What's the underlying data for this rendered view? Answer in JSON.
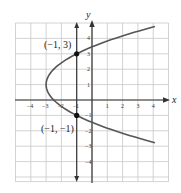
{
  "chart_data": {
    "type": "line",
    "title": "",
    "xlabel": "x",
    "ylabel": "y",
    "xlim": [
      -5,
      5
    ],
    "ylim": [
      -5.3,
      5
    ],
    "grid": true,
    "x_ticks": [
      -4,
      -3,
      -2,
      -1,
      1,
      2,
      3,
      4
    ],
    "y_ticks": [
      4,
      3,
      2,
      1,
      -1,
      -2,
      -3,
      -4
    ],
    "x_tick_labels": [
      "-4",
      "-3",
      "-2",
      "-1",
      "1",
      "2",
      "3",
      "4"
    ],
    "y_tick_labels": [
      "4",
      "3",
      "2",
      "1",
      "-1",
      "-2",
      "-3",
      "-4"
    ],
    "series": [
      {
        "name": "parabola x = ½y² − y − 5/2",
        "equation": "x = 0.5*y^2 - y - 2.5",
        "vertex": [
          -3,
          1
        ],
        "y_range": [
          -2.77,
          4.77
        ],
        "color": "#555555"
      },
      {
        "name": "vertical line x = -1",
        "equation": "x = -1",
        "color": "#333333"
      }
    ],
    "points": [
      {
        "x": -1,
        "y": 3,
        "label": "(−1, 3)"
      },
      {
        "x": -1,
        "y": -1,
        "label": "(−1, −1)"
      }
    ],
    "annotations": [
      "(−1, 3)",
      "(−1, −1)"
    ]
  },
  "labels": {
    "x_axis": "x",
    "y_axis": "y",
    "point_top": "(−1, 3)",
    "point_bottom": "(−1, −1)"
  },
  "colors": {
    "grid": "#c8c8c8",
    "axis": "#333333",
    "curve": "#555555",
    "point": "#111111"
  }
}
